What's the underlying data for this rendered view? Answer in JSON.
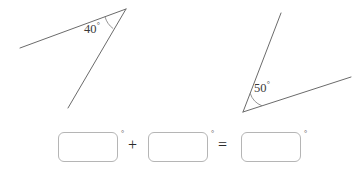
{
  "page": {
    "background_color": "#ffffff",
    "stroke_color": "#6b6b6b",
    "text_color": "#3a3a3a",
    "box_border_color": "#b5b5b5",
    "width": 363,
    "height": 172
  },
  "figures": {
    "left_angle": {
      "name": "acute-angle-40",
      "measure": "40",
      "degree_symbol": "°",
      "label_text": "40",
      "vertex": [
        126,
        9
      ],
      "ray_a_end": [
        20,
        48
      ],
      "ray_b_end": [
        68,
        108
      ]
    },
    "right_angle": {
      "name": "acute-angle-50",
      "measure": "50",
      "degree_symbol": "°",
      "label_text": "50",
      "vertex": [
        243,
        112
      ],
      "ray_a_end": [
        281,
        13
      ],
      "ray_b_end": [
        351,
        77
      ]
    }
  },
  "equation": {
    "operators": {
      "plus": "+",
      "equals": "="
    },
    "degree_symbol": "°",
    "inputs": [
      {
        "name": "addend-1-input",
        "value": "",
        "placeholder": ""
      },
      {
        "name": "addend-2-input",
        "value": "",
        "placeholder": ""
      },
      {
        "name": "sum-input",
        "value": "",
        "placeholder": ""
      }
    ]
  }
}
